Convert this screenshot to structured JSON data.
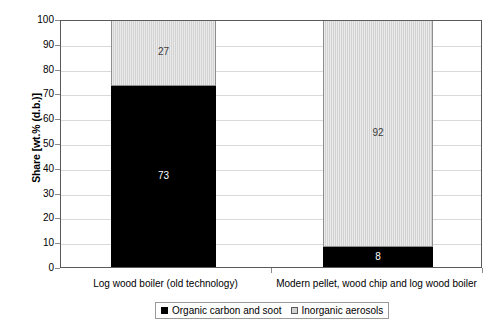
{
  "chart_data": {
    "type": "bar",
    "subtype": "stacked-bar-100",
    "title": "",
    "xlabel": "",
    "ylabel": "Share [wt.% (d.b.)]",
    "ylim": [
      0,
      100
    ],
    "ytick_step": 10,
    "ytick_labels": [
      "0",
      "10",
      "20",
      "30",
      "40",
      "50",
      "60",
      "70",
      "80",
      "90",
      "100"
    ],
    "grid": true,
    "grid_axis": "y",
    "legend_position": "bottom",
    "categories": [
      "Log wood boiler (old technology)",
      "Modern pellet, wood chip and log wood boiler"
    ],
    "series": [
      {
        "name": "Organic carbon and soot",
        "color": "#000000",
        "label_color": "#ffffff",
        "values": [
          73,
          8
        ],
        "value_labels": [
          "73",
          "8"
        ]
      },
      {
        "name": "Inorganic aerosols",
        "color": "#d2d2d2",
        "label_color": "#3a3a3a",
        "values": [
          27,
          92
        ],
        "value_labels": [
          "27",
          "92"
        ]
      }
    ]
  },
  "axes": {
    "y_title": "Share [wt.% (d.b.)]",
    "ticks": [
      {
        "label": "100",
        "value": 100
      },
      {
        "label": "90",
        "value": 90
      },
      {
        "label": "80",
        "value": 80
      },
      {
        "label": "70",
        "value": 70
      },
      {
        "label": "60",
        "value": 60
      },
      {
        "label": "50",
        "value": 50
      },
      {
        "label": "40",
        "value": 40
      },
      {
        "label": "30",
        "value": 30
      },
      {
        "label": "20",
        "value": 20
      },
      {
        "label": "10",
        "value": 10
      },
      {
        "label": "0",
        "value": 0
      }
    ]
  },
  "categories": [
    {
      "label": "Log wood boiler (old technology)"
    },
    {
      "label": "Modern pellet, wood chip and log wood boiler"
    }
  ],
  "bars": [
    {
      "category": "Log wood boiler (old technology)",
      "dark_value": "73",
      "light_value": "27"
    },
    {
      "category": "Modern pellet, wood chip and log wood boiler",
      "dark_value": "8",
      "light_value": "92"
    }
  ],
  "legend": {
    "entries": [
      {
        "label": "Organic carbon and soot",
        "color": "#000000"
      },
      {
        "label": "Inorganic aerosols",
        "color": "#d2d2d2"
      }
    ]
  }
}
